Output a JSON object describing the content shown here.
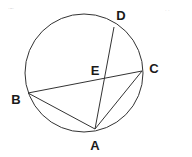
{
  "diagram": {
    "type": "circle-geometry",
    "circle": {
      "cx": 84,
      "cy": 73,
      "r": 59
    },
    "points": {
      "A": {
        "label": "A",
        "x": 95,
        "y": 129,
        "lx": 95,
        "ly": 150
      },
      "B": {
        "label": "B",
        "x": 28,
        "y": 93,
        "lx": 16,
        "ly": 104
      },
      "C": {
        "label": "C",
        "x": 142,
        "y": 71,
        "lx": 154,
        "ly": 73
      },
      "D": {
        "label": "D",
        "x": 114,
        "y": 27,
        "lx": 121,
        "ly": 20
      },
      "E": {
        "label": "E",
        "x": 105,
        "y": 78,
        "lx": 95,
        "ly": 75
      }
    },
    "segments": [
      {
        "from": "B",
        "to": "C"
      },
      {
        "from": "A",
        "to": "D"
      },
      {
        "from": "A",
        "to": "B"
      },
      {
        "from": "A",
        "to": "C"
      }
    ],
    "colors": {
      "stroke": "#333333",
      "label": "#1a1a1a",
      "background": "#ffffff"
    },
    "corner_marks": {
      "left": "·~·",
      "right": "· ·"
    }
  }
}
